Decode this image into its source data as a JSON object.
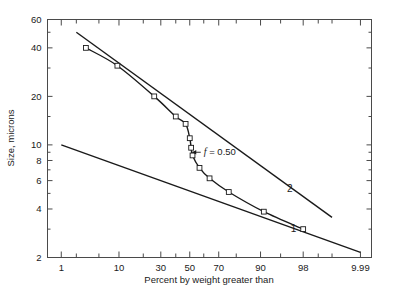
{
  "chart_data": {
    "type": "line",
    "title": "",
    "xlabel": "Percent by weight greater than",
    "ylabel": "Size, microns",
    "x_scale": "probability",
    "y_scale": "log",
    "xlim": [
      0.5,
      99.95
    ],
    "ylim": [
      2,
      60
    ],
    "grid": false,
    "legend_position": "inline-curve-labels",
    "x_ticks_labeled": [
      "1",
      "10",
      "30",
      "50",
      "70",
      "90",
      "98",
      "9.99"
    ],
    "x_tick_values": [
      1,
      10,
      30,
      50,
      70,
      90,
      98,
      99.9
    ],
    "x_ticks_minor": [
      0.5,
      2,
      5,
      20,
      40,
      60,
      80,
      95,
      99,
      99.5
    ],
    "y_ticks_labeled": [
      "60",
      "40",
      "20",
      "10",
      "8",
      "6",
      "4",
      "2"
    ],
    "y_tick_values": [
      60,
      40,
      20,
      10,
      8,
      6,
      4,
      2
    ],
    "y_ticks_minor": [
      50,
      30,
      15,
      9,
      7,
      5,
      3
    ],
    "annotations": [
      {
        "text": "f = 0.50",
        "italic_prefix": "f",
        "rest": " = 0.50",
        "x": 50,
        "y": 9.0,
        "arrow": true
      }
    ],
    "series": [
      {
        "name": "1",
        "label": "1",
        "style": "straight",
        "markers": false,
        "points": [
          {
            "x": 1,
            "y": 10.0
          },
          {
            "x": 99.9,
            "y": 2.15
          }
        ],
        "label_position": {
          "x": 97,
          "y": 2.9
        }
      },
      {
        "name": "2",
        "label": "2",
        "style": "straight",
        "markers": false,
        "points": [
          {
            "x": 2.0,
            "y": 50.0
          },
          {
            "x": 99.5,
            "y": 3.55
          }
        ],
        "label_position": {
          "x": 96.5,
          "y": 5.1
        }
      },
      {
        "name": "data",
        "label": "",
        "style": "curve",
        "markers": true,
        "points": [
          {
            "x": 3.0,
            "y": 40.0
          },
          {
            "x": 9.5,
            "y": 31.0
          },
          {
            "x": 26.0,
            "y": 20.0
          },
          {
            "x": 40.0,
            "y": 15.0
          },
          {
            "x": 47.0,
            "y": 13.5
          },
          {
            "x": 50.0,
            "y": 11.0
          },
          {
            "x": 51.0,
            "y": 9.6
          },
          {
            "x": 52.0,
            "y": 8.6
          },
          {
            "x": 57.0,
            "y": 7.2
          },
          {
            "x": 64.0,
            "y": 6.2
          },
          {
            "x": 76.0,
            "y": 5.1
          },
          {
            "x": 91.0,
            "y": 3.85
          },
          {
            "x": 98.0,
            "y": 3.0
          }
        ]
      }
    ]
  },
  "figure": {
    "background_color": "#ffffff",
    "line_color": "#1a1a1a",
    "frame_color": "#4a4a4a"
  }
}
